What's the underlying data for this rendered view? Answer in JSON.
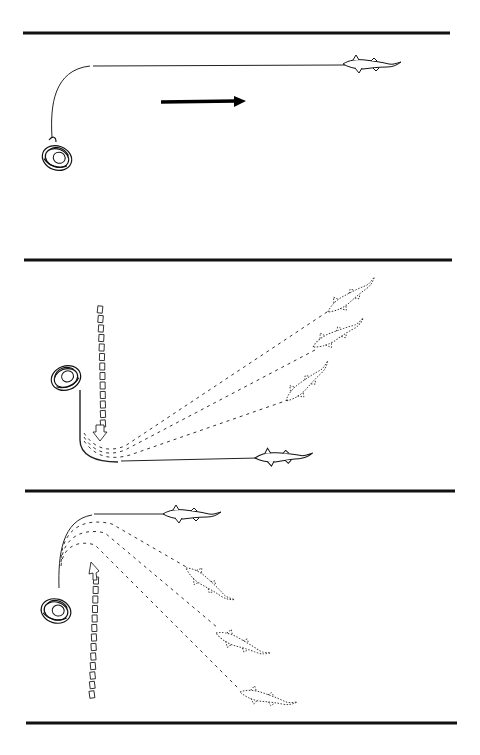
{
  "figure": {
    "title": "",
    "panels": [
      {
        "id": "panel-1",
        "description": "Angler with rod bent, fish running straight away",
        "fish_state": "solid",
        "pressure_arrow": "solid-right",
        "ghost_fish_count": 0
      },
      {
        "id": "panel-2",
        "description": "Angler sweeps rod downward; fish pulled from several positions toward shore",
        "fish_state": "solid",
        "pressure_arrow": "dashed-down",
        "ghost_fish_count": 3
      },
      {
        "id": "panel-3",
        "description": "Angler sweeps rod upward; fish turned from several positions",
        "fish_state": "solid",
        "pressure_arrow": "dashed-up",
        "ghost_fish_count": 3
      }
    ],
    "colors": {
      "ink": "#111111",
      "background": "#ffffff"
    }
  }
}
